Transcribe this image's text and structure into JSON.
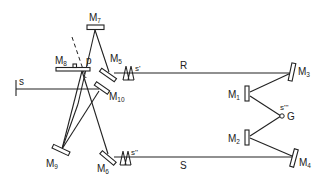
{
  "diagram": {
    "type": "optical-path-schematic",
    "mirrors": [
      {
        "id": "M1",
        "letter": "M",
        "sub": "1"
      },
      {
        "id": "M2",
        "letter": "M",
        "sub": "2"
      },
      {
        "id": "M3",
        "letter": "M",
        "sub": "3"
      },
      {
        "id": "M4",
        "letter": "M",
        "sub": "4"
      },
      {
        "id": "M5",
        "letter": "M",
        "sub": "5"
      },
      {
        "id": "M6",
        "letter": "M",
        "sub": "6"
      },
      {
        "id": "M7",
        "letter": "M",
        "sub": "7"
      },
      {
        "id": "M8",
        "letter": "M",
        "sub": "8"
      },
      {
        "id": "M9",
        "letter": "M",
        "sub": "9"
      },
      {
        "id": "M10",
        "letter": "M",
        "sub": "10"
      }
    ],
    "labels": {
      "p": "p",
      "s_prime": "s'",
      "s_double_prime": "s''",
      "s_triple_prime": "s'''",
      "G": "G",
      "R": "R",
      "S": "S",
      "s_source": "s",
      "I": "I"
    },
    "colors": {
      "line": "#222222",
      "background": "#ffffff"
    }
  }
}
